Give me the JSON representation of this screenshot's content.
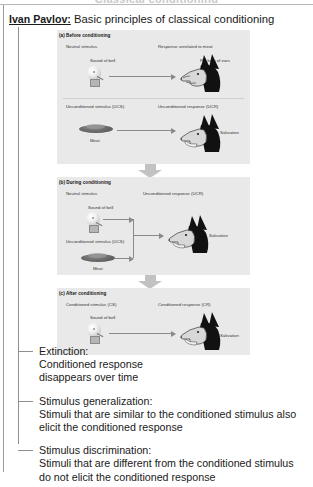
{
  "page": {
    "cut_off_title": "Classical conditioning",
    "header": {
      "name": "Ivan Pavlov:",
      "rest": " Basic principles of classical conditioning"
    }
  },
  "figure": {
    "panels": [
      {
        "label": "(a) Before conditioning",
        "rows": [
          {
            "stimulus_label": "Neutral stimulus",
            "stimulus_name": "Sound of bell",
            "stimulus_icon": "bell-icon",
            "response_label": "Response unrelated to meat",
            "response_name": "Pricking of ears",
            "response_icon": "dog-head-icon"
          },
          {
            "stimulus_label": "Unconditioned stimulus (UCS)",
            "stimulus_name": "Meat",
            "stimulus_icon": "meat-icon",
            "response_label": "Unconditioned response (UCR)",
            "response_name": "Salivation",
            "response_icon": "dog-head-icon"
          }
        ]
      },
      {
        "label": "(b) During conditioning",
        "rows": [
          {
            "stimulus_label": "Neutral stimulus",
            "stimulus_name": "Sound of bell",
            "stimulus_icon": "bell-icon",
            "response_label": "Unconditioned response (UCR)",
            "response_name": "Salivation",
            "response_icon": "dog-head-icon"
          },
          {
            "stimulus_label": "Unconditioned stimulus (UCS)",
            "stimulus_name": "Meat",
            "stimulus_icon": "meat-icon"
          }
        ]
      },
      {
        "label": "(c) After conditioning",
        "rows": [
          {
            "stimulus_label": "Conditioned stimulus (CS)",
            "stimulus_name": "Sound of bell",
            "stimulus_icon": "bell-icon",
            "response_label": "Conditioned response (CR)",
            "response_name": "Salivation",
            "response_icon": "dog-head-icon"
          }
        ]
      }
    ],
    "flow_arrow_icon": "down-arrow-icon"
  },
  "concepts": [
    {
      "title": "Extinction:",
      "lines": [
        "Conditioned response",
        "disappears over time"
      ]
    },
    {
      "title": "Stimulus generalization:",
      "lines": [
        "Stimuli that are similar to the conditioned stimulus also",
        "elicit the conditioned response"
      ]
    },
    {
      "title": "Stimulus discrimination:",
      "lines": [
        "Stimuli that are different from the conditioned stimulus",
        "do not elicit the conditioned response"
      ]
    }
  ],
  "colors": {
    "panel_bg": "#e9e9e9",
    "rule": "#8f8f8f",
    "arrow": "#8a8a8a",
    "flow_arrow": "#c2c2c2",
    "text": "#1a1a1a"
  }
}
